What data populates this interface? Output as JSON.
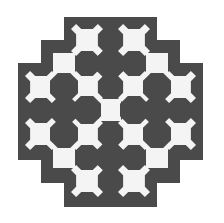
{
  "pattern": {
    "background": "#ffffff",
    "dark_color": "#4a4a4a",
    "light_color": "#f4f4f4",
    "outline": [
      [
        64,
        17
      ],
      [
        157,
        17
      ],
      [
        157,
        40
      ],
      [
        180,
        40
      ],
      [
        180,
        63
      ],
      [
        203,
        63
      ],
      [
        203,
        160
      ],
      [
        180,
        160
      ],
      [
        180,
        183
      ],
      [
        157,
        183
      ],
      [
        157,
        207
      ],
      [
        64,
        207
      ],
      [
        64,
        183
      ],
      [
        41,
        183
      ],
      [
        41,
        160
      ],
      [
        18,
        160
      ],
      [
        18,
        63
      ],
      [
        41,
        63
      ],
      [
        41,
        40
      ],
      [
        64,
        40
      ]
    ],
    "light_tiles": [
      [
        87,
        40
      ],
      [
        134,
        40
      ],
      [
        41,
        87
      ],
      [
        87,
        87
      ],
      [
        134,
        87
      ],
      [
        180,
        87
      ],
      [
        41,
        134
      ],
      [
        87,
        134
      ],
      [
        134,
        134
      ],
      [
        180,
        134
      ],
      [
        87,
        181
      ],
      [
        134,
        181
      ]
    ],
    "light_connectors": [
      [
        64,
        64
      ],
      [
        157,
        64
      ],
      [
        110,
        110
      ],
      [
        64,
        157
      ],
      [
        157,
        157
      ]
    ],
    "dark_octagons": [
      [
        64,
        87
      ],
      [
        110,
        64
      ],
      [
        157,
        87
      ],
      [
        64,
        134
      ],
      [
        110,
        157
      ],
      [
        157,
        134
      ],
      [
        87,
        110
      ],
      [
        134,
        110
      ]
    ],
    "tile_size": 32,
    "connector_size": 22,
    "octagon_size": 28
  }
}
